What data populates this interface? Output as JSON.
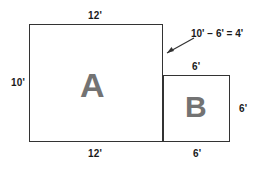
{
  "diagram": {
    "title_present": false,
    "background_color": "#ffffff",
    "stroke_color": "#333333",
    "letter_color": "#737373",
    "label_color": "#1a1a1a",
    "regions": [
      {
        "id": "A",
        "letter": "A",
        "width_label": "12'",
        "height_label": "10'"
      },
      {
        "id": "B",
        "letter": "B",
        "width_label": "6'",
        "height_label": "6'"
      }
    ],
    "labels": {
      "top_a": "12'",
      "left_a": "10'",
      "bottom_a": "12'",
      "top_b": "6'",
      "right_b": "6'",
      "bottom_b": "6'"
    },
    "annotation": {
      "equation": "10' − 6' = 4'",
      "leader": "arrow-pointing-to-step-edge"
    }
  }
}
